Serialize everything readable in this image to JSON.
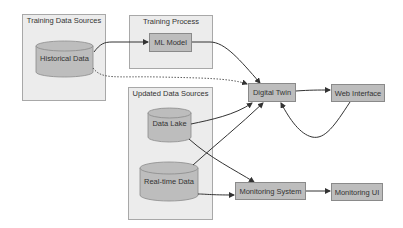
{
  "clusters": {
    "training_data_sources": {
      "label": "Training Data Sources"
    },
    "training_process": {
      "label": "Training Process"
    },
    "updated_data_sources": {
      "label": "Updated Data Sources"
    }
  },
  "nodes": {
    "historical_data": {
      "label": "Historical Data",
      "shape": "cylinder"
    },
    "ml_model": {
      "label": "ML Model",
      "shape": "box"
    },
    "data_lake": {
      "label": "Data Lake",
      "shape": "cylinder"
    },
    "real_time_data": {
      "label": "Real-time Data",
      "shape": "cylinder"
    },
    "digital_twin": {
      "label": "Digital Twin",
      "shape": "box"
    },
    "web_interface": {
      "label": "Web Interface",
      "shape": "box"
    },
    "monitoring_system": {
      "label": "Monitoring System",
      "shape": "box"
    },
    "monitoring_ui": {
      "label": "Monitoring UI",
      "shape": "box"
    }
  },
  "edges": [
    {
      "from": "Historical Data",
      "to": "ML Model",
      "style": "solid"
    },
    {
      "from": "Historical Data",
      "to": "Digital Twin",
      "style": "dotted"
    },
    {
      "from": "ML Model",
      "to": "Digital Twin",
      "style": "solid"
    },
    {
      "from": "Data Lake",
      "to": "Digital Twin",
      "style": "solid"
    },
    {
      "from": "Data Lake",
      "to": "Monitoring System",
      "style": "solid"
    },
    {
      "from": "Real-time Data",
      "to": "Digital Twin",
      "style": "solid"
    },
    {
      "from": "Real-time Data",
      "to": "Monitoring System",
      "style": "solid"
    },
    {
      "from": "Digital Twin",
      "to": "Web Interface",
      "style": "solid"
    },
    {
      "from": "Web Interface",
      "to": "Digital Twin",
      "style": "solid"
    },
    {
      "from": "Monitoring System",
      "to": "Monitoring UI",
      "style": "solid"
    }
  ],
  "colors": {
    "cluster_fill": "#ececec",
    "cluster_border": "#a8a8a8",
    "node_fill": "#bdbdbd",
    "node_border": "#8a8a8a",
    "edge": "#333333"
  }
}
